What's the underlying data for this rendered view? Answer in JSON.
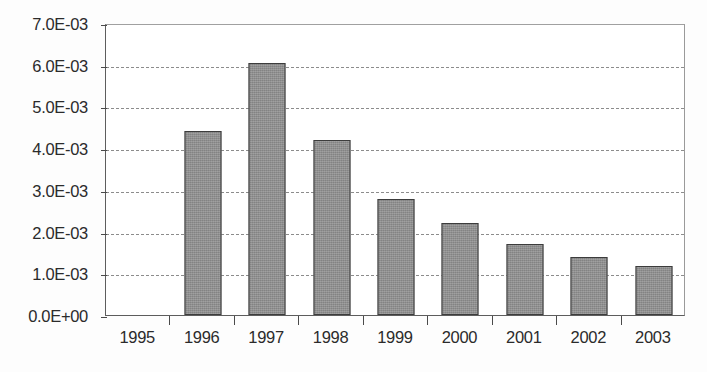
{
  "chart_data": {
    "type": "bar",
    "title": "",
    "subtitle": "",
    "xlabel": "",
    "ylabel": "",
    "categories": [
      "1995",
      "1996",
      "1997",
      "1998",
      "1999",
      "2000",
      "2001",
      "2002",
      "2003"
    ],
    "values": [
      0,
      0.0044,
      0.00605,
      0.0042,
      0.00277,
      0.0022,
      0.0017,
      0.0014,
      0.00118
    ],
    "series": [
      {
        "name": "",
        "values": [
          0,
          0.0044,
          0.00605,
          0.0042,
          0.00277,
          0.0022,
          0.0017,
          0.0014,
          0.00118
        ]
      }
    ],
    "ylim": [
      0,
      0.007
    ],
    "ytick_values": [
      0,
      0.001,
      0.002,
      0.003,
      0.004,
      0.005,
      0.006,
      0.007
    ],
    "ytick_labels": [
      "0.0E+00",
      "1.0E-03",
      "2.0E-03",
      "3.0E-03",
      "4.0E-03",
      "5.0E-03",
      "6.0E-03",
      "7.0E-03"
    ],
    "grid": true,
    "grid_axis": "y",
    "grid_style": "dashed",
    "legend": false,
    "legend_position": "none",
    "bar_color": "#8d8d8d",
    "bar_border_color": "#3c3c3c",
    "gridline_color": "#8c8c8c",
    "axis_color": "#4a4a4a",
    "background_color": "#ffffff",
    "annotations": []
  }
}
